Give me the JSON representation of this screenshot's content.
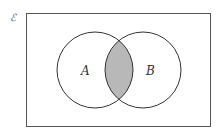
{
  "diagram": {
    "type": "venn",
    "universal_set_symbol": "ℰ",
    "sets": [
      {
        "label": "A"
      },
      {
        "label": "B"
      }
    ],
    "shaded_region": "A ∩ B",
    "colors": {
      "stroke": "#333333",
      "shade": "#b8b8b8",
      "background": "#ffffff"
    }
  }
}
